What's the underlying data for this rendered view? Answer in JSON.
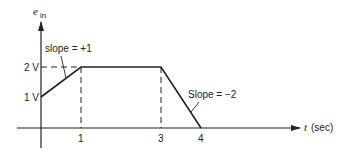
{
  "diagram": {
    "y_axis": {
      "label": "e",
      "label_subscript": "in"
    },
    "x_axis": {
      "label_var": "t",
      "label_unit": "(sec)"
    },
    "y_ticks": [
      {
        "label": "1 V",
        "value": 1
      },
      {
        "label": "2 V",
        "value": 2
      }
    ],
    "x_ticks": [
      {
        "label": "1",
        "value": 1
      },
      {
        "label": "3",
        "value": 3
      },
      {
        "label": "4",
        "value": 4
      }
    ],
    "annotations": {
      "slope_up": "slope = +1",
      "slope_down": "Slope = −2"
    },
    "waveform_points": [
      {
        "t": 0,
        "v": 1
      },
      {
        "t": 1,
        "v": 2
      },
      {
        "t": 3,
        "v": 2
      },
      {
        "t": 4,
        "v": 0
      }
    ],
    "colors": {
      "line": "#222222",
      "background": "#ffffff"
    }
  }
}
